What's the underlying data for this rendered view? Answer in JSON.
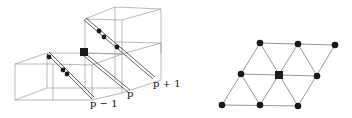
{
  "figure": {
    "left_panel": {
      "description": "3D stacked cubes with diagonal rods carrying particles",
      "labels": [
        {
          "id": "label-p-minus-1",
          "text": "p − 1",
          "x": 90,
          "y": 107
        },
        {
          "id": "label-p",
          "text": "p",
          "x": 127,
          "y": 97
        },
        {
          "id": "label-p-plus-1",
          "text": "p + 1",
          "x": 153,
          "y": 87
        }
      ]
    },
    "right_panel": {
      "description": "Triangular lattice projection",
      "nodes": [
        {
          "x": 260,
          "y": 43,
          "shape": "circle"
        },
        {
          "x": 298,
          "y": 44,
          "shape": "circle"
        },
        {
          "x": 335,
          "y": 45,
          "shape": "circle"
        },
        {
          "x": 241,
          "y": 74,
          "shape": "circle"
        },
        {
          "x": 279,
          "y": 75,
          "shape": "square"
        },
        {
          "x": 317,
          "y": 76,
          "shape": "circle"
        },
        {
          "x": 222,
          "y": 105,
          "shape": "circle"
        },
        {
          "x": 260,
          "y": 105,
          "shape": "circle"
        },
        {
          "x": 298,
          "y": 106,
          "shape": "circle"
        }
      ]
    },
    "colors": {
      "edge": "#8a8a8a",
      "marker": "#1a1a1a",
      "background": "#ffffff"
    }
  }
}
